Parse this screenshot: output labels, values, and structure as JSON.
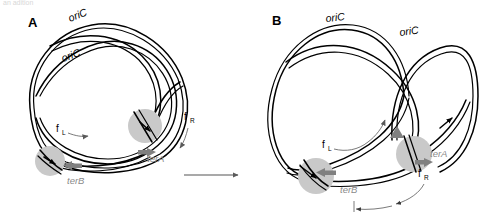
{
  "figure": {
    "clipped_top_text": "an adition",
    "background_color": "#ffffff",
    "strand_color": "#000000",
    "fork_blob_color": "#c9c9c9",
    "ter_label_color": "#8a8a8a",
    "arrow_gray_color": "#808080"
  },
  "panels": [
    {
      "id": "A",
      "letter": "A",
      "origins": [
        {
          "label": "oriC"
        },
        {
          "label": "oriC"
        }
      ],
      "termini": [
        {
          "label": "terA"
        },
        {
          "label": "terB"
        }
      ],
      "forks": [
        {
          "label": "f",
          "subscript": "L",
          "name": "left-fork"
        },
        {
          "label": "f",
          "subscript": "R",
          "name": "right-fork"
        }
      ]
    },
    {
      "id": "B",
      "letter": "B",
      "origins": [
        {
          "label": "oriC"
        },
        {
          "label": "oriC"
        }
      ],
      "termini": [
        {
          "label": "terA"
        },
        {
          "label": "terB"
        }
      ],
      "forks": [
        {
          "label": "f",
          "subscript": "L",
          "name": "left-fork"
        },
        {
          "label": "f",
          "subscript": "R",
          "name": "right-fork"
        }
      ]
    }
  ],
  "transition": {
    "name": "panel-transition-arrow",
    "direction": "right"
  }
}
